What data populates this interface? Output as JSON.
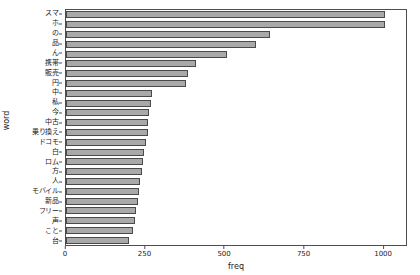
{
  "chart_data": {
    "type": "bar",
    "orientation": "horizontal",
    "title": "",
    "xlabel": "freq",
    "ylabel": "word",
    "xlim": [
      0,
      1075
    ],
    "grid": false,
    "legend": null,
    "xticks": [
      0,
      250,
      500,
      750,
      1000
    ],
    "xtick_labels": [
      "0",
      "250",
      "500",
      "750",
      "1000"
    ],
    "categories": [
      "スマ",
      "ホ",
      "の",
      "品",
      "ん",
      "携帯",
      "販売",
      "円",
      "中",
      "私",
      "今",
      "中古",
      "乗り換え",
      "ドコモ",
      "白",
      "ロム",
      "方",
      "人",
      "モバイル",
      "新品",
      "フリー",
      "声",
      "こと",
      "台"
    ],
    "values": [
      1010,
      1008,
      645,
      600,
      508,
      412,
      385,
      378,
      272,
      268,
      262,
      260,
      258,
      252,
      248,
      245,
      240,
      235,
      232,
      228,
      222,
      218,
      212,
      200
    ],
    "bar_color": "#a9a9a9",
    "bar_edge_color": "#4a4a4a",
    "axis_color": "#4d4d4d",
    "background_color": "#ffffff"
  }
}
